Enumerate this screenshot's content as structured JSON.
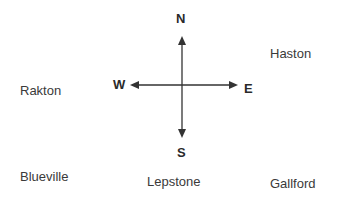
{
  "compass": {
    "north": "N",
    "south": "S",
    "east": "E",
    "west": "W",
    "color": "#2a2a2a"
  },
  "towns": {
    "haston": "Haston",
    "rakton": "Rakton",
    "blueville": "Blueville",
    "lepstone": "Lepstone",
    "gallford": "Gallford"
  }
}
